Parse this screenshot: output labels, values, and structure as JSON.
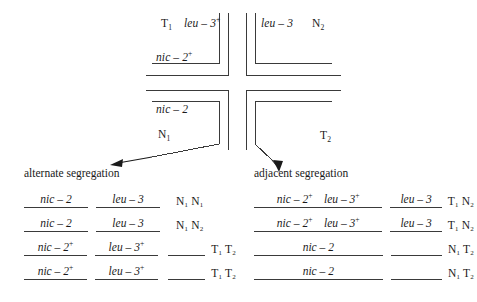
{
  "diagram": {
    "title_visible": false,
    "cross_labels": [
      {
        "id": "top-left-T1",
        "text": "T",
        "sub": "1",
        "italic": false,
        "x": 161,
        "y": 18
      },
      {
        "id": "top-left-leu",
        "text": "leu – 3",
        "sup": "+",
        "italic": true,
        "x": 181,
        "y": 18
      },
      {
        "id": "top-left-nic",
        "text": "nic – 2",
        "sup": "+",
        "italic": true,
        "x": 156,
        "y": 52
      },
      {
        "id": "top-right-leu",
        "text": "leu – 3",
        "italic": true,
        "x": 259,
        "y": 18
      },
      {
        "id": "top-right-N2",
        "text": "N",
        "sub": "2",
        "italic": false,
        "x": 311,
        "y": 18
      },
      {
        "id": "bottom-left-nic",
        "text": "nic – 2",
        "italic": true,
        "x": 156,
        "y": 105
      },
      {
        "id": "bottom-left-N1",
        "text": "N",
        "sub": "1",
        "italic": false,
        "x": 158,
        "y": 130
      },
      {
        "id": "bottom-right-T2",
        "text": "T",
        "sub": "2",
        "italic": false,
        "x": 319,
        "y": 131
      }
    ],
    "colors": {
      "line": "#3a3a3a",
      "text": "#1a1a1a",
      "background": "#ffffff"
    }
  },
  "alternate": {
    "heading": "alternate segregation",
    "rows": [
      {
        "col1": "nic – 2",
        "col1_sup": "",
        "col2": "leu – 3",
        "col2_sup": "",
        "col3": "",
        "centromeres": "N₁ N₁",
        "col3_line": false
      },
      {
        "col1": "nic – 2",
        "col1_sup": "",
        "col2": "leu – 3",
        "col2_sup": "",
        "col3": "",
        "centromeres": "N₁ N₂",
        "col3_line": false
      },
      {
        "col1": "nic – 2",
        "col1_sup": "+",
        "col2": "leu – 3",
        "col2_sup": "+",
        "col3": "",
        "centromeres": "T₁ T₂",
        "col3_line": true
      },
      {
        "col1": "nic – 2",
        "col1_sup": "+",
        "col2": "leu – 3",
        "col2_sup": "+",
        "col3": "",
        "centromeres": "T₁ T₂",
        "col3_line": true
      }
    ]
  },
  "adjacent": {
    "heading": "adjacent segregation",
    "rows": [
      {
        "col1a": "nic – 2",
        "col1a_sup": "+",
        "col1b": "leu – 3",
        "col1b_sup": "+",
        "col2": "leu – 3",
        "col2_sup": "",
        "centromeres": "T₁ N₂",
        "col2_line": true
      },
      {
        "col1a": "nic – 2",
        "col1a_sup": "+",
        "col1b": "leu – 3",
        "col1b_sup": "+",
        "col2": "leu – 3",
        "col2_sup": "",
        "centromeres": "T₁ N₂",
        "col2_line": true
      },
      {
        "col1a": "nic – 2",
        "col1a_sup": "",
        "col1b": "",
        "col1b_sup": "",
        "col2": "",
        "col2_sup": "",
        "centromeres": "N₁ T₂",
        "col2_line": true
      },
      {
        "col1a": "nic – 2",
        "col1a_sup": "",
        "col1b": "",
        "col1b_sup": "",
        "col2": "",
        "col2_sup": "",
        "centromeres": "N₁ T₂",
        "col2_line": true
      }
    ]
  }
}
